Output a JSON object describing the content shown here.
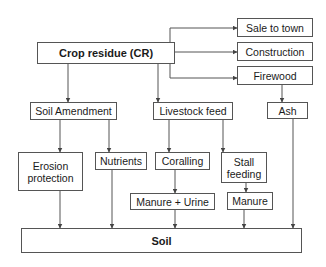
{
  "diagram": {
    "type": "flowchart",
    "nodes": {
      "crop_residue": "Crop residue (CR)",
      "sale_to_town": "Sale to town",
      "construction": "Construction",
      "firewood": "Firewood",
      "soil_amendment": "Soil Amendment",
      "livestock_feed": "Livestock feed",
      "ash": "Ash",
      "erosion_protection": "Erosion protection",
      "nutrients": "Nutrients",
      "coralling": "Coralling",
      "stall_feeding": "Stall feeding",
      "manure_urine": "Manure + Urine",
      "manure": "Manure",
      "soil": "Soil"
    },
    "edges": [
      [
        "crop_residue",
        "sale_to_town"
      ],
      [
        "crop_residue",
        "construction"
      ],
      [
        "crop_residue",
        "firewood"
      ],
      [
        "crop_residue",
        "soil_amendment"
      ],
      [
        "crop_residue",
        "livestock_feed"
      ],
      [
        "firewood",
        "ash"
      ],
      [
        "soil_amendment",
        "erosion_protection"
      ],
      [
        "soil_amendment",
        "nutrients"
      ],
      [
        "livestock_feed",
        "coralling"
      ],
      [
        "livestock_feed",
        "stall_feeding"
      ],
      [
        "coralling",
        "manure_urine"
      ],
      [
        "stall_feeding",
        "manure"
      ],
      [
        "erosion_protection",
        "soil"
      ],
      [
        "nutrients",
        "soil"
      ],
      [
        "manure_urine",
        "soil"
      ],
      [
        "manure",
        "soil"
      ],
      [
        "ash",
        "soil"
      ]
    ],
    "colors": {
      "line": "#555555",
      "text": "#1a1a1a",
      "background": "#ffffff"
    }
  }
}
